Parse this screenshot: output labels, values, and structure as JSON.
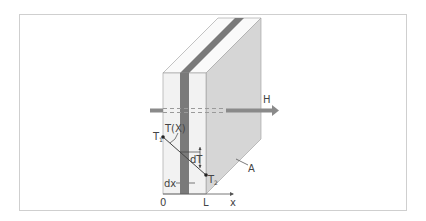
{
  "figure": {
    "labels": {
      "heat_flow": "H",
      "temperature_profile": "T(X)",
      "hot_temp": "T",
      "hot_sub": "1",
      "cold_temp": "T",
      "cold_sub": "2",
      "temp_diff": "dT",
      "thickness_element": "dx",
      "area": "A",
      "origin": "0",
      "thickness": "L",
      "x_axis": "x"
    },
    "colors": {
      "slab_front": "#f2f2f2",
      "slab_top": "#fafafa",
      "slab_side": "#d6d6d6",
      "stripe": "#7a7a7a",
      "arrow": "#8a8a8a",
      "line": "#555555",
      "frame": "#cfcfcf"
    }
  }
}
